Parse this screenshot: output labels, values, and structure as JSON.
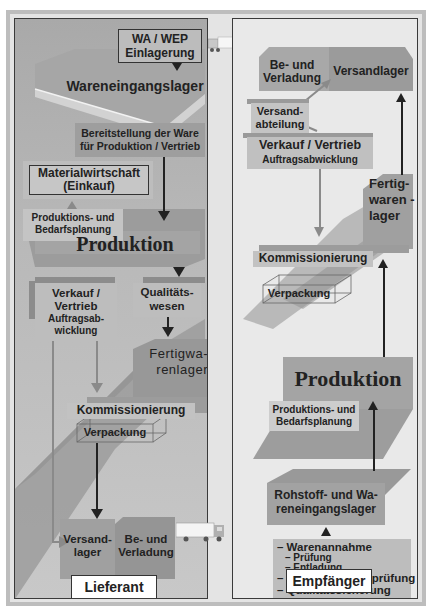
{
  "left_panel": {
    "label": "Lieferant",
    "wa_wep": [
      "WA / WEP",
      "Einlagerung"
    ],
    "wareneingangslager": "Wareneingangslager",
    "bereitstellung": [
      "Bereitstellung der Ware",
      "für Produktion / Vertrieb"
    ],
    "materialwirtschaft": [
      "Materialwirtschaft",
      "(Einkauf)"
    ],
    "produktionsplanung": [
      "Produktions- und",
      "Bedarfsplanung"
    ],
    "produktion": "Produktion",
    "verkauf": [
      "Verkauf /",
      "Vertrieb",
      "Auftragsab-",
      "wicklung"
    ],
    "qualitaetswesen": [
      "Qualitäts-",
      "wesen"
    ],
    "fertigwarenlager": [
      "Fertigwa-",
      "renlager"
    ],
    "kommissionierung": "Kommissionierung",
    "verpackung": "Verpackung",
    "versandlager": [
      "Versand-",
      "lager"
    ],
    "verladung": [
      "Be- und",
      "Verladung"
    ]
  },
  "right_panel": {
    "label": "Empfänger",
    "verladung": [
      "Be- und",
      "Verladung"
    ],
    "versandlager": "Versandlager",
    "versandabteilung": [
      "Versand-",
      "abteilung"
    ],
    "verkauf": [
      "Verkauf / Vertrieb",
      "Auftragsabwicklung"
    ],
    "fertigwarenlager": [
      "Fertig-",
      "waren -",
      "lager"
    ],
    "kommissionierung": "Kommissionierung",
    "verpackung": "Verpackung",
    "produktion": "Produktion",
    "produktionsplanung": [
      "Produktions- und",
      "Bedarfsplanung"
    ],
    "rohstofflager": [
      "Rohstoff- und Wa-",
      "reneingangslager"
    ],
    "wareneingang_list": [
      "– Warenannahme",
      "– Prüfung",
      "– Entladung",
      "– Wareneingangsprüfung",
      "– Qualitätssicherung"
    ]
  },
  "colors": {
    "frame": "#bdbdbd",
    "left_panel_bg": "#b0b0b0",
    "right_panel_bg": "#e9e9e9",
    "box_dark": "#a3a3a3",
    "box_light": "#bdbdbd",
    "arrow_dark": "#222222",
    "arrow_grey": "#8a8a8a"
  }
}
